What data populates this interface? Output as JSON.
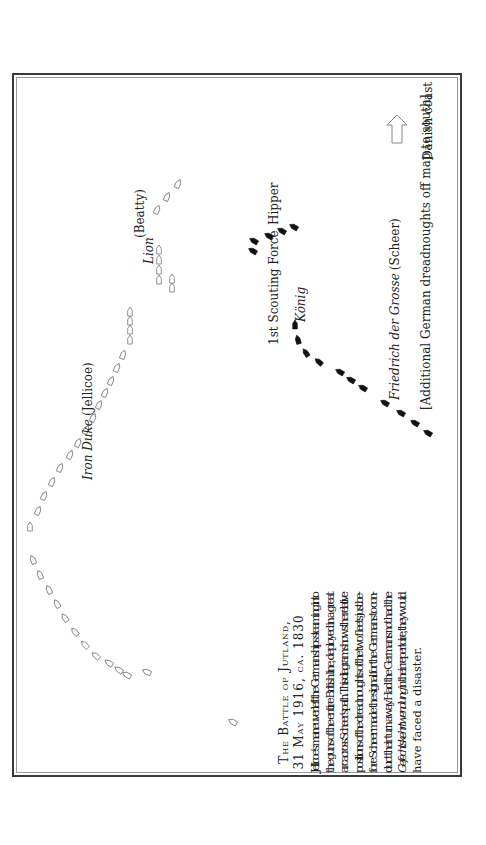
{
  "caption": {
    "title": "The Battle of Jutland,",
    "subtitle": "31 May 1916, ca. 1830",
    "lines": [
      "Jellicoe’s maneuver left the German ships steaming into",
      "the guns of the entire British line, deployed in a great",
      "arc across Scheer’s path. This diagram shows the relative",
      "positions of the dreadnoughts of the two fleets just be-",
      "fore Scheer made the signal for the Germans to con-",
      "duct their turn away. Had the Germans not had the",
      "Gefechtskehrtwendung in their repertoire, they would",
      "have faced a disaster."
    ]
  },
  "labels": {
    "iron_duke_ship": "Iron Duke",
    "iron_duke_admiral": "(Jellicoe)",
    "lion_ship": "Lion",
    "lion_admiral": "(Beatty)",
    "scouting_force": "1st Scouting Force",
    "hipper": "Hipper",
    "konig": "König",
    "friedrich_ship": "Friedrich der Grosse",
    "friedrich_admiral": "(Scheer)",
    "additional_note": "[Additional German dreadnoughts off map to south]",
    "danish_coast": "Danish coast"
  },
  "legend": {
    "british_ship_style": "outline",
    "german_ship_style": "filled",
    "direction_arrow": "arrow-to-danish-coast"
  },
  "colors": {
    "british": "#777777",
    "german": "#111111",
    "text": "#222222"
  },
  "fleets": {
    "british_battle_fleet": {
      "ship_count": 28
    },
    "british_battlecruisers": {
      "ship_count": 7
    },
    "german_scouting_force": {
      "ship_count": 5
    },
    "german_battle_fleet_shown": {
      "ship_count": 11
    }
  }
}
